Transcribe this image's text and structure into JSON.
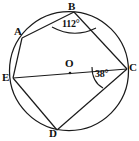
{
  "figure": {
    "type": "circle-geometry-diagram",
    "stroke_color": "#1a1a1a",
    "background_color": "#ffffff",
    "circle": {
      "center_label": "O",
      "center_x": 69,
      "center_y": 71,
      "radius": 60
    },
    "points": [
      {
        "label": "A",
        "x": 22,
        "y": 38,
        "label_x": 14,
        "label_y": 26
      },
      {
        "label": "B",
        "x": 74,
        "y": 12,
        "label_x": 68,
        "label_y": 1
      },
      {
        "label": "C",
        "x": 127,
        "y": 69,
        "label_x": 129,
        "label_y": 62
      },
      {
        "label": "D",
        "x": 57,
        "y": 130,
        "label_x": 49,
        "label_y": 128
      },
      {
        "label": "E",
        "x": 13,
        "y": 78,
        "label_x": 2,
        "label_y": 72
      }
    ],
    "center_dot": {
      "x": 70,
      "y": 73
    },
    "center_label_pos": {
      "x": 65,
      "y": 58
    },
    "chords": [
      {
        "name": "chord-AB",
        "from": "A",
        "to": "B"
      },
      {
        "name": "chord-BC",
        "from": "B",
        "to": "C"
      },
      {
        "name": "chord-AE",
        "from": "A",
        "to": "E"
      },
      {
        "name": "chord-ED",
        "from": "E",
        "to": "D"
      },
      {
        "name": "chord-DC",
        "from": "D",
        "to": "C"
      },
      {
        "name": "diameter-EC",
        "from": "E",
        "to": "C"
      }
    ],
    "angles": [
      {
        "name": "angle-at-B",
        "vertex": "B",
        "value": "112°",
        "label_x": 62,
        "label_y": 19,
        "arc_path": "M 52 27 Q 74 39 96 28"
      },
      {
        "name": "angle-at-C",
        "vertex": "C",
        "value": "38°",
        "label_x": 95,
        "label_y": 69,
        "arc_path": "M 92 67 Q 92 82 103 88"
      }
    ]
  }
}
